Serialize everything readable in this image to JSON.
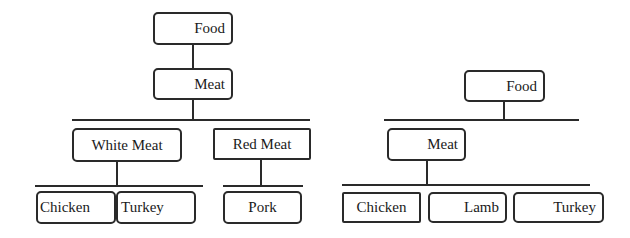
{
  "left_tree": {
    "root": "Food",
    "level1": "Meat",
    "level2": [
      "White Meat",
      "Red Meat"
    ],
    "white_meat_children": [
      "Chicken",
      "Turkey"
    ],
    "red_meat_children": [
      "Pork"
    ]
  },
  "right_tree": {
    "root": "Food",
    "level1": "Meat",
    "meat_children": [
      "Chicken",
      "Lamb",
      "Turkey"
    ]
  }
}
